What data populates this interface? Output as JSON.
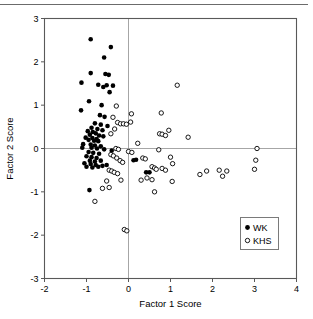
{
  "figure": {
    "has_top_rule": true,
    "background_color": "#ffffff",
    "frame_color": "#595959",
    "zero_line_color": "#a6a6a6",
    "marker_color": "#000000"
  },
  "chart_data": {
    "type": "scatter",
    "title": "",
    "xlabel": "Factor 1 Score",
    "ylabel": "Factor 2 Score",
    "xlim": [
      -2,
      4
    ],
    "ylim": [
      -3,
      3
    ],
    "xticks": [
      -2,
      -1,
      0,
      1,
      2,
      3,
      4
    ],
    "yticks": [
      -3,
      -2,
      -1,
      0,
      1,
      2,
      3
    ],
    "xticklabels": [
      "-2",
      "-1",
      "0",
      "1",
      "2",
      "3",
      "4"
    ],
    "yticklabels": [
      "-3",
      "-2",
      "-1",
      "0",
      "1",
      "2",
      "3"
    ],
    "grid": false,
    "zero_lines": true,
    "legend_position": "lower-right",
    "series": [
      {
        "name": "WK",
        "marker": "filled-circle",
        "marker_size": 4.6,
        "color": "#000000",
        "points": [
          [
            -0.9,
            2.52
          ],
          [
            -0.42,
            2.34
          ],
          [
            -0.58,
            2.1
          ],
          [
            -0.9,
            1.74
          ],
          [
            -0.55,
            1.72
          ],
          [
            -0.47,
            1.7
          ],
          [
            -1.12,
            1.52
          ],
          [
            -0.72,
            1.47
          ],
          [
            -0.52,
            1.46
          ],
          [
            -0.37,
            1.45
          ],
          [
            -0.6,
            1.42
          ],
          [
            -0.45,
            1.3
          ],
          [
            -0.94,
            1.09
          ],
          [
            -0.64,
            1.0
          ],
          [
            -1.13,
            0.88
          ],
          [
            -0.68,
            0.77
          ],
          [
            -0.57,
            0.73
          ],
          [
            -0.8,
            0.58
          ],
          [
            -0.66,
            0.55
          ],
          [
            -0.5,
            0.52
          ],
          [
            -0.88,
            0.48
          ],
          [
            -0.74,
            0.45
          ],
          [
            -0.62,
            0.42
          ],
          [
            -0.97,
            0.4
          ],
          [
            -0.85,
            0.38
          ],
          [
            -0.78,
            0.35
          ],
          [
            -0.92,
            0.32
          ],
          [
            -0.7,
            0.3
          ],
          [
            -0.6,
            0.28
          ],
          [
            -1.02,
            0.25
          ],
          [
            -0.86,
            0.24
          ],
          [
            -0.76,
            0.22
          ],
          [
            -0.95,
            0.2
          ],
          [
            -0.82,
            0.18
          ],
          [
            -0.72,
            0.17
          ],
          [
            -1.08,
            0.1
          ],
          [
            -0.9,
            0.09
          ],
          [
            -0.8,
            0.07
          ],
          [
            -0.66,
            0.05
          ],
          [
            -0.88,
            0.02
          ],
          [
            -0.75,
            0.0
          ],
          [
            -1.1,
            0.02
          ],
          [
            -0.58,
            -0.02
          ],
          [
            -0.4,
            -0.05
          ],
          [
            -0.95,
            -0.08
          ],
          [
            -0.84,
            -0.1
          ],
          [
            -0.7,
            -0.12
          ],
          [
            -1.0,
            -0.18
          ],
          [
            -0.88,
            -0.2
          ],
          [
            -0.76,
            -0.22
          ],
          [
            -0.92,
            -0.28
          ],
          [
            -0.8,
            -0.3
          ],
          [
            -0.66,
            -0.28
          ],
          [
            -1.05,
            -0.34
          ],
          [
            -0.9,
            -0.36
          ],
          [
            -0.78,
            -0.38
          ],
          [
            -1.0,
            -0.42
          ],
          [
            -0.86,
            -0.44
          ],
          [
            -0.72,
            -0.42
          ],
          [
            -0.62,
            -0.4
          ],
          [
            -0.52,
            -0.38
          ],
          [
            -0.93,
            -0.96
          ],
          [
            0.42,
            -0.55
          ],
          [
            0.5,
            -0.55
          ],
          [
            0.12,
            -0.27
          ],
          [
            0.18,
            -0.26
          ]
        ]
      },
      {
        "name": "KHS",
        "marker": "open-circle",
        "marker_size": 4.4,
        "color": "#000000",
        "points": [
          [
            1.16,
            1.46
          ],
          [
            -0.29,
            0.98
          ],
          [
            0.07,
            0.8
          ],
          [
            0.78,
            0.82
          ],
          [
            -0.37,
            0.72
          ],
          [
            -0.26,
            0.6
          ],
          [
            -0.19,
            0.57
          ],
          [
            -0.12,
            0.57
          ],
          [
            -0.05,
            0.56
          ],
          [
            0.05,
            0.61
          ],
          [
            -0.33,
            0.45
          ],
          [
            -0.42,
            0.34
          ],
          [
            0.74,
            0.34
          ],
          [
            0.8,
            0.33
          ],
          [
            0.88,
            0.3
          ],
          [
            0.96,
            0.42
          ],
          [
            1.42,
            0.26
          ],
          [
            0.22,
            0.12
          ],
          [
            -0.3,
            0.0
          ],
          [
            -0.24,
            -0.02
          ],
          [
            0.0,
            -0.07
          ],
          [
            0.08,
            -0.09
          ],
          [
            0.72,
            -0.03
          ],
          [
            3.06,
            0.0
          ],
          [
            -0.42,
            -0.14
          ],
          [
            -0.36,
            -0.17
          ],
          [
            -0.28,
            -0.22
          ],
          [
            -0.2,
            -0.28
          ],
          [
            -0.14,
            -0.32
          ],
          [
            0.34,
            -0.22
          ],
          [
            0.4,
            -0.24
          ],
          [
            1.0,
            -0.2
          ],
          [
            3.03,
            -0.27
          ],
          [
            -0.46,
            -0.5
          ],
          [
            -0.4,
            -0.52
          ],
          [
            -0.34,
            -0.55
          ],
          [
            -0.26,
            -0.58
          ],
          [
            0.56,
            -0.42
          ],
          [
            0.62,
            -0.45
          ],
          [
            0.66,
            -0.48
          ],
          [
            0.8,
            -0.46
          ],
          [
            0.88,
            -0.5
          ],
          [
            1.05,
            -0.35
          ],
          [
            1.7,
            -0.6
          ],
          [
            1.86,
            -0.52
          ],
          [
            2.16,
            -0.5
          ],
          [
            2.24,
            -0.64
          ],
          [
            2.34,
            -0.52
          ],
          [
            3.0,
            -0.48
          ],
          [
            -0.52,
            -0.75
          ],
          [
            -0.18,
            -0.73
          ],
          [
            0.3,
            -0.73
          ],
          [
            0.44,
            -0.68
          ],
          [
            0.56,
            -0.72
          ],
          [
            1.04,
            -0.76
          ],
          [
            -0.62,
            -0.92
          ],
          [
            -0.46,
            -0.9
          ],
          [
            0.62,
            -1.0
          ],
          [
            -0.8,
            -1.22
          ],
          [
            -0.1,
            -1.87
          ],
          [
            -0.04,
            -1.9
          ]
        ]
      }
    ]
  },
  "legend": {
    "entries": [
      {
        "label": "WK",
        "marker": "filled-circle"
      },
      {
        "label": "KHS",
        "marker": "open-circle"
      }
    ]
  }
}
